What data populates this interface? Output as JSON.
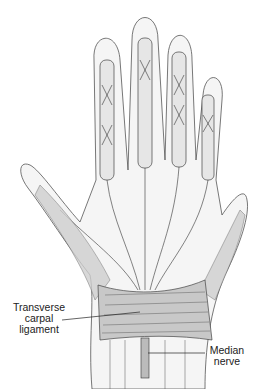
{
  "figure": {
    "labels": [
      {
        "id": "transverse-carpal-ligament",
        "lines": [
          "Transverse",
          "carpal",
          "ligament"
        ]
      },
      {
        "id": "median-nerve",
        "lines": [
          "Median",
          "nerve"
        ]
      }
    ],
    "colors": {
      "outline": "#333333",
      "skin_fill": "#f4f4f4",
      "tissue_fill": "#d9d9d9",
      "background": "#ffffff"
    }
  }
}
